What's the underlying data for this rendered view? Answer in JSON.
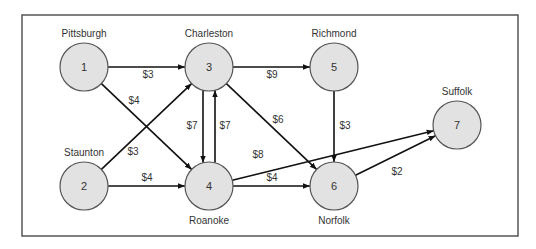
{
  "diagram": {
    "type": "directed-network",
    "frame": {
      "x": 22,
      "y": 15,
      "width": 496,
      "height": 221
    },
    "node_style": {
      "fill": "#e2e2e2",
      "stroke": "#555555",
      "radius": 24
    },
    "nodes": [
      {
        "id": "1",
        "number": "1",
        "name": "Pittsburgh",
        "cx": 84,
        "cy": 67,
        "label_pos": "above"
      },
      {
        "id": "2",
        "number": "2",
        "name": "Staunton",
        "cx": 84,
        "cy": 186,
        "label_pos": "above"
      },
      {
        "id": "3",
        "number": "3",
        "name": "Charleston",
        "cx": 209,
        "cy": 67,
        "label_pos": "above"
      },
      {
        "id": "4",
        "number": "4",
        "name": "Roanoke",
        "cx": 209,
        "cy": 186,
        "label_pos": "below"
      },
      {
        "id": "5",
        "number": "5",
        "name": "Richmond",
        "cx": 334,
        "cy": 67,
        "label_pos": "above"
      },
      {
        "id": "6",
        "number": "6",
        "name": "Norfolk",
        "cx": 334,
        "cy": 186,
        "label_pos": "below"
      },
      {
        "id": "7",
        "number": "7",
        "name": "Suffolk",
        "cx": 457,
        "cy": 125,
        "label_pos": "above"
      }
    ],
    "edges": [
      {
        "from": "1",
        "to": "3",
        "cost": "$3",
        "lx": 148,
        "ly": 78
      },
      {
        "from": "1",
        "to": "4",
        "cost": "$4",
        "lx": 134,
        "ly": 104
      },
      {
        "from": "2",
        "to": "3",
        "cost": "$3",
        "lx": 133,
        "ly": 155
      },
      {
        "from": "2",
        "to": "4",
        "cost": "$4",
        "lx": 147,
        "ly": 181
      },
      {
        "from": "3",
        "to": "4",
        "cost": "$7",
        "lx": 192,
        "ly": 129,
        "offset": -6
      },
      {
        "from": "4",
        "to": "3",
        "cost": "$7",
        "lx": 225,
        "ly": 129,
        "offset": 6
      },
      {
        "from": "3",
        "to": "5",
        "cost": "$9",
        "lx": 272,
        "ly": 78
      },
      {
        "from": "3",
        "to": "6",
        "cost": "$6",
        "lx": 278,
        "ly": 123
      },
      {
        "from": "4",
        "to": "7",
        "cost": "$8",
        "lx": 258,
        "ly": 158
      },
      {
        "from": "4",
        "to": "6",
        "cost": "$4",
        "lx": 272,
        "ly": 181
      },
      {
        "from": "5",
        "to": "6",
        "cost": "$3",
        "lx": 345,
        "ly": 129
      },
      {
        "from": "6",
        "to": "7",
        "cost": "$2",
        "lx": 397,
        "ly": 175
      }
    ]
  }
}
